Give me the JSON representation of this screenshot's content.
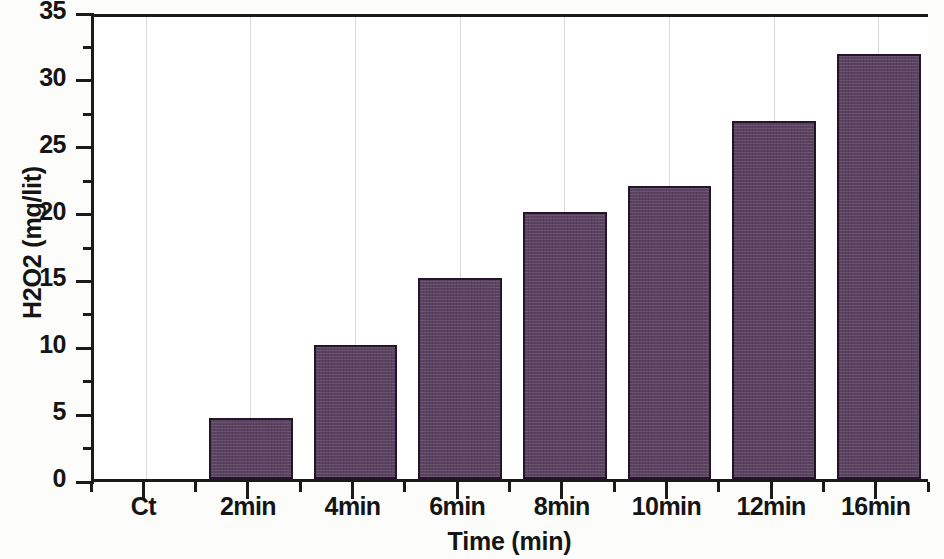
{
  "chart_data": {
    "type": "bar",
    "title": "",
    "xlabel": "Time (min)",
    "ylabel": "H2O2 (mg/lit)",
    "categories": [
      "Ct",
      "2min",
      "4min",
      "6min",
      "8min",
      "10min",
      "12min",
      "16min"
    ],
    "values": [
      0,
      4.6,
      10.0,
      15.0,
      20.0,
      21.9,
      26.8,
      31.8
    ],
    "ylim": [
      0,
      35
    ],
    "ytick_labels": [
      "0",
      "5",
      "10",
      "15",
      "20",
      "25",
      "30",
      "35"
    ],
    "ytick_values": [
      0,
      5,
      10,
      15,
      20,
      25,
      30,
      35
    ],
    "yminor_values": [
      2.5,
      7.5,
      12.5,
      17.5,
      22.5,
      27.5,
      32.5
    ],
    "grid": "vertical-only",
    "legend": "none",
    "bar_color": "#5a4160",
    "bar_edge_color": "#241528",
    "axis_color": "#1b1b1b",
    "gridline_color": "#d9d9d9",
    "plot_background": "#ffffff",
    "page_background": "#fcfcfa"
  }
}
